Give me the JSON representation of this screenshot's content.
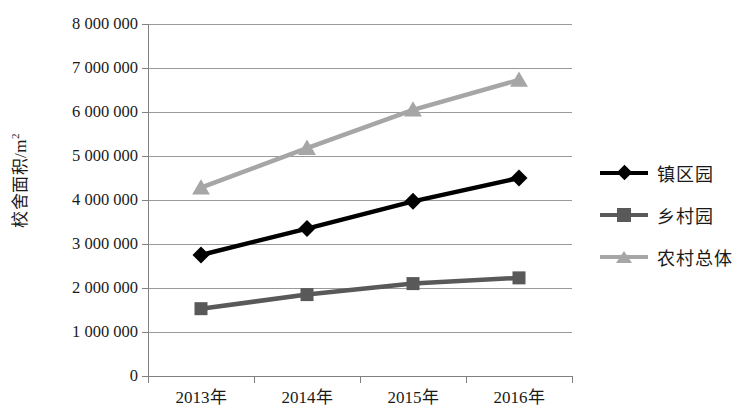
{
  "chart_data": {
    "type": "line",
    "title": "",
    "xlabel": "",
    "ylabel": "校舍面积/m²",
    "categories": [
      "2013年",
      "2014年",
      "2015年",
      "2016年"
    ],
    "ylim": [
      0,
      8000000
    ],
    "ytick_step": 1000000,
    "ytick_labels": [
      "8 000 000",
      "7 000 000",
      "6 000 000",
      "5 000 000",
      "4 000 000",
      "3 000 000",
      "2 000 000",
      "1 000 000",
      "0"
    ],
    "ytick_values": [
      8000000,
      7000000,
      6000000,
      5000000,
      4000000,
      3000000,
      2000000,
      1000000,
      0
    ],
    "grid": true,
    "legend_position": "right",
    "series": [
      {
        "name": "镇区园",
        "color": "#000000",
        "marker": "diamond",
        "values": [
          2750000,
          3350000,
          3970000,
          4500000
        ]
      },
      {
        "name": "乡村园",
        "color": "#595959",
        "marker": "square",
        "values": [
          1530000,
          1850000,
          2100000,
          2230000
        ]
      },
      {
        "name": "农村总体",
        "color": "#a6a6a6",
        "marker": "triangle",
        "values": [
          4280000,
          5180000,
          6050000,
          6730000
        ]
      }
    ]
  },
  "colors": {
    "axis": "#808080",
    "grid": "#9a9a9a",
    "background": "#ffffff"
  }
}
